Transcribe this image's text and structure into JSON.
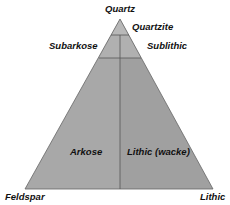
{
  "diagram": {
    "type": "ternary-classification",
    "vertices": {
      "top": "Quartz",
      "bottom_left": "Feldspar",
      "bottom_right": "Lithic"
    },
    "regions": [
      {
        "label": "Quartzite"
      },
      {
        "label": "Subarkose"
      },
      {
        "label": "Sublithic"
      },
      {
        "label": "Arkose"
      },
      {
        "label": "Lithic (wacke)"
      }
    ],
    "colors": {
      "fill_top": "#b4b4b4",
      "fill_left": "#a6a6a6",
      "fill_right": "#9e9e9e",
      "lines": "#555555"
    }
  }
}
